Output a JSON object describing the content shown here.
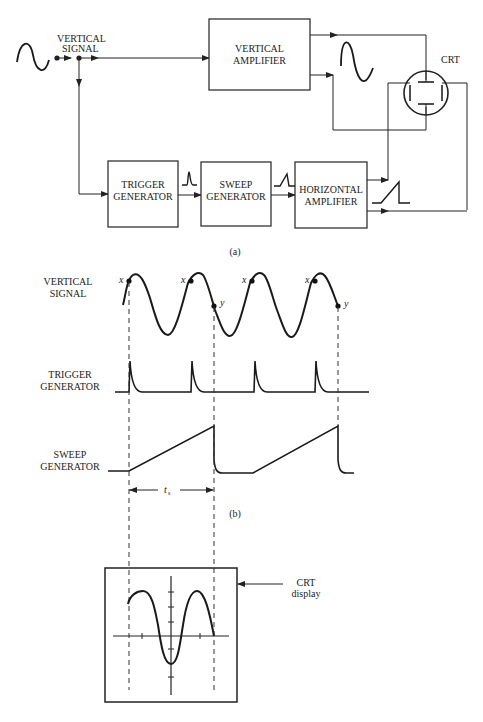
{
  "part_a": {
    "caption": "(a)",
    "input_label": [
      "VERTICAL",
      "SIGNAL"
    ],
    "blocks": {
      "vertical_amplifier": [
        "VERTICAL",
        "AMPLIFIER"
      ],
      "trigger_generator": [
        "TRIGGER",
        "GENERATOR"
      ],
      "sweep_generator": [
        "SWEEP",
        "GENERATOR"
      ],
      "horizontal_amplifier": [
        "HORIZONTAL",
        "AMPLIFIER"
      ]
    },
    "crt_label": "CRT"
  },
  "part_b": {
    "caption": "(b)",
    "rows": {
      "vertical_signal": [
        "VERTICAL",
        "SIGNAL"
      ],
      "trigger_generator": [
        "TRIGGER",
        "GENERATOR"
      ],
      "sweep_generator": [
        "SWEEP",
        "GENERATOR"
      ]
    },
    "point_x": "x",
    "point_y": "y",
    "sweep_time_label": "t",
    "sweep_time_sub": "s"
  },
  "crt_display": {
    "label": [
      "CRT",
      "display"
    ]
  }
}
